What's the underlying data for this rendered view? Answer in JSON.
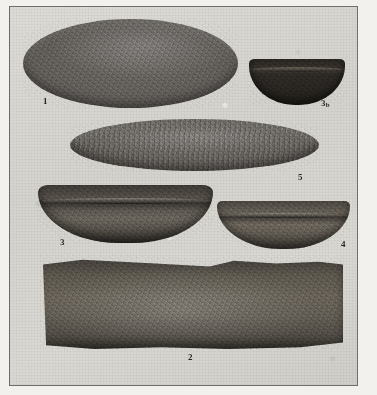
{
  "plate": {
    "kind": "archaeological-photographic-plate",
    "background_color": "#d6d5cf",
    "frame_color": "#6e6e6a",
    "page_color": "#f2f1ee",
    "specimen_count": 6
  },
  "specimens": [
    {
      "id": "1",
      "label": "1",
      "label_sub": "",
      "description": "large flat oval grinding slab seen from above",
      "color": "#605c58"
    },
    {
      "id": "3b",
      "label": "3",
      "label_sub": "b",
      "description": "small dark shallow stone bowl seen in profile",
      "color": "#2d2a26"
    },
    {
      "id": "5",
      "label": "5",
      "label_sub": "",
      "description": "long narrow ridged mano or pestle seen from the side",
      "color": "#615d58"
    },
    {
      "id": "3",
      "label": "3",
      "label_sub": "",
      "description": "deep stone basin bowl seen in profile with rim",
      "color": "#56514a"
    },
    {
      "id": "4",
      "label": "4",
      "label_sub": "",
      "description": "shallow stone bowl seen in profile with rim",
      "color": "#635d55"
    },
    {
      "id": "2",
      "label": "2",
      "label_sub": "",
      "description": "large rectangular stone metate slab seen from above",
      "color": "#645f56"
    }
  ]
}
